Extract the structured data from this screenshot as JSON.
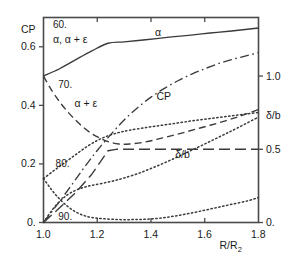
{
  "chart_data": {
    "type": "line",
    "title": "",
    "xlabel": "R/R2",
    "xlabel_display": "R/R",
    "xlabel_sub": "2",
    "ylabel_left": "CP",
    "ylabel_right": "δ/b",
    "xlim": [
      1.0,
      1.8
    ],
    "xticks": [
      1.0,
      1.2,
      1.4,
      1.6,
      1.8
    ],
    "xticklabels": [
      "1.0",
      "1.2",
      "1.4",
      "1.6",
      "1.8"
    ],
    "ylim_left": [
      0.0,
      0.7
    ],
    "yticks_left": [
      0.0,
      0.2,
      0.4,
      0.6
    ],
    "yticklabels_left": [
      "0.",
      "0.2",
      "0.4",
      "0.6"
    ],
    "ylim_right": [
      0.0,
      1.4
    ],
    "yticks_right": [
      0.0,
      0.5,
      1.0
    ],
    "yticklabels_right": [
      "0.",
      "0.5",
      "1.0"
    ],
    "grid": false,
    "legend": "inline-labels",
    "header_note_1": "60.",
    "header_note_2": "α, α + ε",
    "annotations": [
      {
        "text": "60.",
        "x": 1.035,
        "y_left": 0.675
      },
      {
        "text": "α, α + ε",
        "x": 1.035,
        "y_left": 0.625
      },
      {
        "text": "70.",
        "x": 1.055,
        "y_left": 0.47
      },
      {
        "text": "80.",
        "x": 1.045,
        "y_left": 0.2
      },
      {
        "text": "90.",
        "x": 1.055,
        "y_left": 0.018
      },
      {
        "text": "α",
        "x": 1.415,
        "y_left": 0.648
      },
      {
        "text": "CP",
        "x": 1.42,
        "y_left": 0.43
      },
      {
        "text": "α + ε",
        "x": 1.115,
        "y_left": 0.405
      },
      {
        "text": "δ/b",
        "x": 1.49,
        "y_left": 0.232
      }
    ],
    "series": [
      {
        "name": "α",
        "style": "solid",
        "axis": "left",
        "points": [
          [
            1.0,
            0.5
          ],
          [
            1.06,
            0.525
          ],
          [
            1.12,
            0.556
          ],
          [
            1.18,
            0.586
          ],
          [
            1.24,
            0.612
          ],
          [
            1.3,
            0.617
          ],
          [
            1.38,
            0.624
          ],
          [
            1.46,
            0.632
          ],
          [
            1.54,
            0.639
          ],
          [
            1.62,
            0.647
          ],
          [
            1.7,
            0.654
          ],
          [
            1.8,
            0.664
          ]
        ]
      },
      {
        "name": "α + ε",
        "style": "dashed",
        "axis": "left",
        "points": [
          [
            1.0,
            0.5
          ],
          [
            1.03,
            0.452
          ],
          [
            1.06,
            0.412
          ],
          [
            1.09,
            0.378
          ],
          [
            1.12,
            0.349
          ],
          [
            1.15,
            0.324
          ],
          [
            1.18,
            0.303
          ],
          [
            1.21,
            0.288
          ],
          [
            1.24,
            0.276
          ],
          [
            1.28,
            0.268
          ],
          [
            1.32,
            0.268
          ],
          [
            1.38,
            0.275
          ],
          [
            1.44,
            0.288
          ],
          [
            1.5,
            0.302
          ],
          [
            1.56,
            0.317
          ],
          [
            1.62,
            0.332
          ],
          [
            1.68,
            0.348
          ],
          [
            1.74,
            0.366
          ],
          [
            1.8,
            0.386
          ]
        ]
      },
      {
        "name": "CP",
        "style": "dashdot",
        "axis": "left",
        "points": [
          [
            1.0,
            0.0
          ],
          [
            1.05,
            0.06
          ],
          [
            1.1,
            0.122
          ],
          [
            1.15,
            0.186
          ],
          [
            1.2,
            0.246
          ],
          [
            1.25,
            0.3
          ],
          [
            1.3,
            0.35
          ],
          [
            1.35,
            0.392
          ],
          [
            1.4,
            0.428
          ],
          [
            1.45,
            0.458
          ],
          [
            1.5,
            0.484
          ],
          [
            1.55,
            0.506
          ],
          [
            1.6,
            0.525
          ],
          [
            1.65,
            0.542
          ],
          [
            1.7,
            0.556
          ],
          [
            1.75,
            0.568
          ],
          [
            1.8,
            0.58
          ]
        ]
      },
      {
        "name": "δ/b step",
        "style": "longdash",
        "axis": "right",
        "points": [
          [
            1.0,
            0.0
          ],
          [
            1.06,
            0.1
          ],
          [
            1.12,
            0.205
          ],
          [
            1.18,
            0.33
          ],
          [
            1.24,
            0.49
          ],
          [
            1.27,
            0.5
          ],
          [
            1.4,
            0.5
          ],
          [
            1.6,
            0.5
          ],
          [
            1.8,
            0.5
          ]
        ]
      },
      {
        "name": "70.",
        "style": "dotted",
        "axis": "left",
        "points": [
          [
            1.0,
            0.15
          ],
          [
            1.04,
            0.178
          ],
          [
            1.08,
            0.205
          ],
          [
            1.12,
            0.232
          ],
          [
            1.16,
            0.258
          ],
          [
            1.2,
            0.28
          ],
          [
            1.24,
            0.296
          ],
          [
            1.28,
            0.307
          ],
          [
            1.32,
            0.315
          ],
          [
            1.38,
            0.324
          ],
          [
            1.44,
            0.332
          ],
          [
            1.5,
            0.34
          ],
          [
            1.56,
            0.348
          ],
          [
            1.62,
            0.355
          ],
          [
            1.68,
            0.362
          ],
          [
            1.74,
            0.369
          ],
          [
            1.8,
            0.376
          ]
        ]
      },
      {
        "name": "80.",
        "style": "dotted",
        "axis": "left",
        "points": [
          [
            1.0,
            0.0
          ],
          [
            1.03,
            0.04
          ],
          [
            1.06,
            0.072
          ],
          [
            1.09,
            0.095
          ],
          [
            1.12,
            0.11
          ],
          [
            1.15,
            0.12
          ],
          [
            1.18,
            0.127
          ],
          [
            1.22,
            0.134
          ],
          [
            1.26,
            0.142
          ],
          [
            1.3,
            0.152
          ],
          [
            1.36,
            0.17
          ],
          [
            1.42,
            0.192
          ],
          [
            1.48,
            0.216
          ],
          [
            1.54,
            0.242
          ],
          [
            1.6,
            0.268
          ],
          [
            1.66,
            0.295
          ],
          [
            1.72,
            0.322
          ],
          [
            1.8,
            0.36
          ]
        ]
      },
      {
        "name": "90.",
        "style": "dotted",
        "axis": "left",
        "points": [
          [
            1.0,
            0.15
          ],
          [
            1.03,
            0.112
          ],
          [
            1.06,
            0.08
          ],
          [
            1.09,
            0.055
          ],
          [
            1.12,
            0.036
          ],
          [
            1.15,
            0.024
          ],
          [
            1.18,
            0.017
          ],
          [
            1.22,
            0.013
          ],
          [
            1.28,
            0.01
          ],
          [
            1.34,
            0.01
          ],
          [
            1.4,
            0.012
          ],
          [
            1.46,
            0.018
          ],
          [
            1.52,
            0.027
          ],
          [
            1.58,
            0.038
          ],
          [
            1.64,
            0.05
          ],
          [
            1.7,
            0.062
          ],
          [
            1.76,
            0.074
          ],
          [
            1.8,
            0.085
          ]
        ]
      }
    ]
  }
}
